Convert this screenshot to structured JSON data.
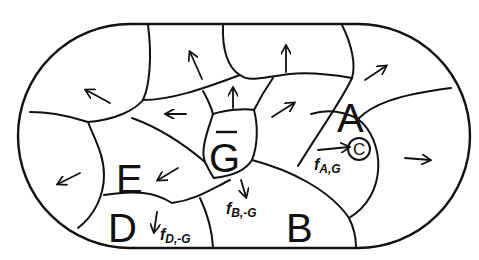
{
  "diagram": {
    "shape": "stadium-partitioned-into-cells",
    "colors": {
      "ink": "#111111",
      "background": "#ffffff"
    },
    "regions": {
      "A": {
        "label": "A"
      },
      "B": {
        "label": "B"
      },
      "D": {
        "label": "D"
      },
      "E": {
        "label": "E"
      },
      "G": {
        "label": "G",
        "overline": true
      }
    },
    "circled_label": "C",
    "fluxes": {
      "a_g": {
        "symbol": "f",
        "subscript": "A,G",
        "vector": true
      },
      "b_g": {
        "symbol": "f",
        "subscript": "B,-G"
      },
      "d_g": {
        "symbol": "f",
        "subscript": "D,-G"
      }
    },
    "arrows": [
      {
        "region": "left-top",
        "direction": "up-left"
      },
      {
        "region": "top-left",
        "direction": "up-left"
      },
      {
        "region": "top-middle",
        "direction": "up"
      },
      {
        "region": "top-right",
        "direction": "up-right"
      },
      {
        "region": "center-left",
        "direction": "left"
      },
      {
        "region": "center-top",
        "direction": "up"
      },
      {
        "region": "center-right",
        "direction": "up-right"
      },
      {
        "region": "left-bottom",
        "direction": "down-left"
      },
      {
        "region": "E",
        "direction": "down-left"
      },
      {
        "region": "right",
        "direction": "right"
      },
      {
        "region": "B",
        "direction": "down"
      },
      {
        "region": "D",
        "direction": "down"
      }
    ]
  }
}
